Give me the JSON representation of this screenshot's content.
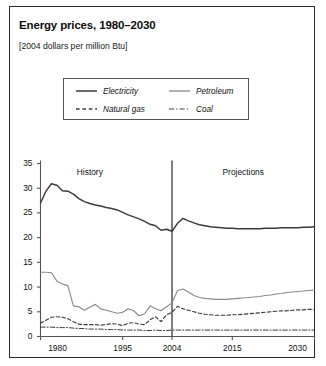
{
  "title": "Energy prices, 1980–2030",
  "subtitle": "[2004 dollars per million Btu]",
  "legend": {
    "items": [
      {
        "label": "Electricity",
        "style": "solid",
        "color": "#3a3a3a",
        "width": 1.5
      },
      {
        "label": "Petroleum",
        "style": "solid",
        "color": "#8a8a8a",
        "width": 1.2
      },
      {
        "label": "Natural gas",
        "style": "dashed",
        "color": "#3a3a3a",
        "width": 1.2
      },
      {
        "label": "Coal",
        "style": "dashdot",
        "color": "#3a3a3a",
        "width": 1.1
      }
    ]
  },
  "annotations": {
    "history": "History",
    "projections": "Projections",
    "divider_year": 2004
  },
  "chart_data": {
    "type": "line",
    "title": "Energy prices, 1980–2030",
    "subtitle": "[2004 dollars per million Btu]",
    "xlabel": "",
    "ylabel": "",
    "xlim": [
      1980,
      2030
    ],
    "ylim": [
      0,
      35
    ],
    "yticks": [
      0,
      5,
      10,
      15,
      20,
      25,
      30,
      35
    ],
    "ytick_labels": [
      "0",
      "5",
      "10",
      "15",
      "20",
      "25",
      "30",
      "35"
    ],
    "xticks": [
      1980,
      1995,
      2004,
      2015,
      2030
    ],
    "xtick_labels": [
      "1980",
      "1995",
      "2004",
      "2015",
      "2030"
    ],
    "grid": false,
    "legend_position": "top-center",
    "annotations": [
      {
        "text": "History",
        "x": 1989,
        "y": 33
      },
      {
        "text": "Projections",
        "x": 2017,
        "y": 33
      },
      {
        "text": "divider",
        "x": 2004,
        "type": "vline"
      }
    ],
    "x": [
      1980,
      1981,
      1982,
      1983,
      1984,
      1985,
      1986,
      1987,
      1988,
      1989,
      1990,
      1991,
      1992,
      1993,
      1994,
      1995,
      1996,
      1997,
      1998,
      1999,
      2000,
      2001,
      2002,
      2003,
      2004,
      2005,
      2006,
      2007,
      2008,
      2009,
      2010,
      2011,
      2012,
      2013,
      2014,
      2015,
      2016,
      2017,
      2018,
      2019,
      2020,
      2021,
      2022,
      2023,
      2024,
      2025,
      2026,
      2027,
      2028,
      2029,
      2030
    ],
    "series": [
      {
        "name": "Electricity",
        "style": "solid",
        "color": "#3a3a3a",
        "values": [
          27.0,
          29.4,
          30.9,
          30.6,
          29.5,
          29.4,
          28.8,
          27.9,
          27.3,
          26.9,
          26.6,
          26.4,
          26.1,
          25.9,
          25.6,
          25.1,
          24.6,
          24.2,
          23.8,
          23.3,
          22.7,
          22.4,
          21.5,
          21.7,
          21.3,
          22.9,
          23.9,
          23.4,
          23.0,
          22.6,
          22.4,
          22.2,
          22.1,
          22.0,
          21.9,
          21.9,
          21.8,
          21.8,
          21.8,
          21.8,
          21.8,
          21.9,
          21.9,
          21.9,
          22.0,
          22.0,
          22.0,
          22.0,
          22.1,
          22.1,
          22.2
        ]
      },
      {
        "name": "Petroleum",
        "style": "solid",
        "color": "#8a8a8a",
        "values": [
          13.0,
          13.0,
          12.9,
          11.2,
          10.6,
          10.3,
          6.2,
          6.0,
          5.3,
          5.9,
          6.5,
          5.6,
          5.3,
          5.0,
          4.7,
          4.9,
          5.6,
          5.2,
          4.2,
          4.6,
          6.2,
          5.6,
          5.2,
          6.0,
          6.8,
          9.3,
          9.6,
          9.0,
          8.3,
          7.9,
          7.7,
          7.6,
          7.5,
          7.5,
          7.5,
          7.6,
          7.7,
          7.8,
          7.9,
          8.0,
          8.1,
          8.3,
          8.4,
          8.6,
          8.7,
          8.9,
          9.0,
          9.1,
          9.2,
          9.3,
          9.4
        ]
      },
      {
        "name": "Natural gas",
        "style": "dashed",
        "color": "#3a3a3a",
        "values": [
          2.7,
          3.3,
          3.9,
          4.0,
          3.9,
          3.6,
          3.0,
          2.5,
          2.4,
          2.4,
          2.4,
          2.3,
          2.4,
          2.6,
          2.5,
          2.2,
          2.7,
          2.8,
          2.5,
          2.4,
          3.4,
          4.0,
          3.0,
          4.4,
          4.9,
          6.1,
          5.6,
          5.3,
          5.0,
          4.7,
          4.5,
          4.4,
          4.3,
          4.3,
          4.3,
          4.4,
          4.4,
          4.5,
          4.6,
          4.7,
          4.8,
          4.9,
          5.0,
          5.1,
          5.2,
          5.2,
          5.3,
          5.4,
          5.4,
          5.5,
          5.5
        ]
      },
      {
        "name": "Coal",
        "style": "dashdot",
        "color": "#3a3a3a",
        "values": [
          1.9,
          1.9,
          1.9,
          1.8,
          1.8,
          1.8,
          1.7,
          1.6,
          1.6,
          1.5,
          1.5,
          1.5,
          1.4,
          1.4,
          1.4,
          1.3,
          1.3,
          1.3,
          1.3,
          1.2,
          1.2,
          1.3,
          1.2,
          1.2,
          1.3,
          1.3,
          1.3,
          1.3,
          1.3,
          1.3,
          1.3,
          1.3,
          1.3,
          1.3,
          1.3,
          1.3,
          1.3,
          1.3,
          1.3,
          1.3,
          1.3,
          1.3,
          1.3,
          1.3,
          1.3,
          1.3,
          1.3,
          1.3,
          1.3,
          1.3,
          1.3
        ]
      }
    ]
  }
}
